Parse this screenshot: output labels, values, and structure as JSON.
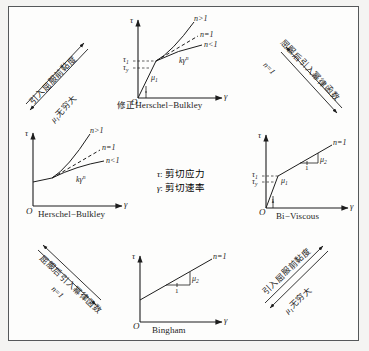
{
  "figure": {
    "type": "relationship-diagram",
    "background_color": "#f4f4f2",
    "panel_color": "#fdfdfc",
    "border_color": "#55585a",
    "ink_color": "#1d1d1d"
  },
  "legend": {
    "entries": [
      {
        "symbol": "τ",
        "separator": ":",
        "meaning": "剪切应力"
      },
      {
        "symbol": "γ",
        "separator": ":",
        "meaning": "剪切速率"
      }
    ]
  },
  "axes": {
    "y_label": "τ",
    "x_label": "γ",
    "origin_label": "O"
  },
  "charts": [
    {
      "id": "modified-herschel-bulkley",
      "caption_cn": "修正",
      "caption_en": "Herschel−Bulkley",
      "caption_full": "修正Herschel−Bulkley",
      "position": "top-center",
      "curve_labels": [
        "n>1",
        "n=1",
        "n<1"
      ],
      "annotations": [
        "kγⁿ",
        "μ₁",
        "τ₁",
        "τᵧ"
      ],
      "tick_labels": [
        "τ",
        "τ"
      ],
      "tick_subs": [
        "1",
        "y"
      ],
      "slope_label": "μ",
      "slope_sub": "1",
      "power_law": {
        "k": "k",
        "gamma": "γ",
        "exponent": "n"
      }
    },
    {
      "id": "herschel-bulkley",
      "caption_cn": "",
      "caption_en": "Herschel−Bulkley",
      "caption_full": "Herschel−Bulkley",
      "position": "middle-left",
      "curve_labels": [
        "n>1",
        "n=1",
        "n<1"
      ],
      "annotations": [
        "kγⁿ"
      ],
      "power_law": {
        "k": "k",
        "gamma": "γ",
        "exponent": "n"
      }
    },
    {
      "id": "bi-viscous",
      "caption_cn": "",
      "caption_en": "Bi−Viscous",
      "caption_full": "Bi−Viscous",
      "position": "middle-right",
      "curve_labels": [
        "n=1"
      ],
      "annotations": [
        "μ₂",
        "μ₁",
        "1",
        "1",
        "τ₁",
        "τᵧ"
      ],
      "slope_upper": {
        "symbol": "μ",
        "sub": "2",
        "run": "1"
      },
      "slope_lower": {
        "symbol": "μ",
        "sub": "1",
        "run": "1"
      },
      "tick_subs": [
        "1",
        "y"
      ]
    },
    {
      "id": "bingham",
      "caption_cn": "",
      "caption_en": "Bingham",
      "caption_full": "Bingham",
      "position": "bottom-center",
      "curve_labels": [
        "n=1"
      ],
      "annotations": [
        "μ₂",
        "1"
      ],
      "slope": {
        "symbol": "μ",
        "sub": "2",
        "run": "1"
      }
    }
  ],
  "transitions": [
    {
      "id": "top-left",
      "upper_label": "引入屈服前黏度",
      "lower_label_symbol": "μ",
      "lower_label_sub": "1",
      "lower_label_text": "无穷大",
      "lower_label_full": "μ₁无穷大",
      "direction": "bidirectional"
    },
    {
      "id": "top-right",
      "upper_label": "屈服后引入幂律函数",
      "lower_label_full": "n=1",
      "direction": "bidirectional"
    },
    {
      "id": "bottom-left",
      "upper_label": "屈服后引入幂律函数",
      "lower_label_full": "n=1",
      "direction": "bidirectional"
    },
    {
      "id": "bottom-right",
      "upper_label": "引入屈服前黏度",
      "lower_label_symbol": "μ",
      "lower_label_sub": "1",
      "lower_label_text": "无穷大",
      "lower_label_full": "μ₁无穷大",
      "direction": "bidirectional"
    }
  ]
}
